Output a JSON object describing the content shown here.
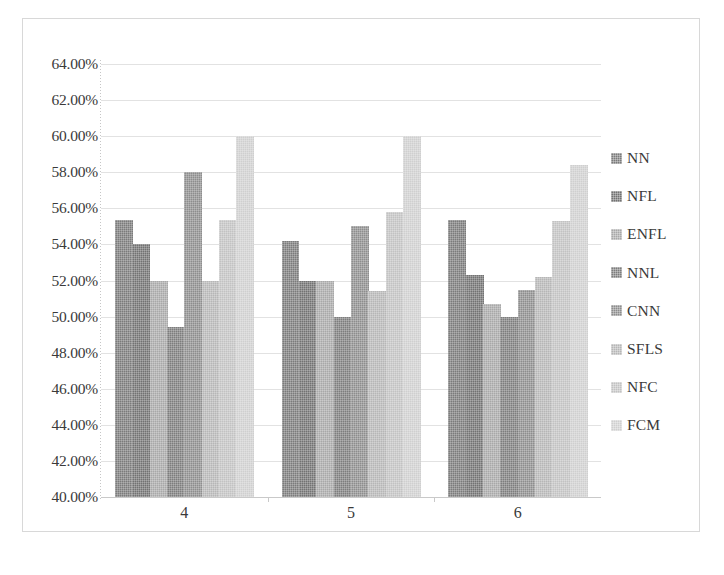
{
  "chart_data": {
    "type": "bar",
    "title": "",
    "subtitle": "",
    "xlabel": "",
    "ylabel": "",
    "categories": [
      "4",
      "5",
      "6"
    ],
    "ylim": [
      40,
      64
    ],
    "ytick_values": [
      64,
      62,
      60,
      58,
      56,
      54,
      52,
      50,
      48,
      46,
      44,
      42,
      40
    ],
    "ytick_labels": [
      "64.00%",
      "62.00%",
      "60.00%",
      "58.00%",
      "56.00%",
      "54.00%",
      "52.00%",
      "50.00%",
      "48.00%",
      "46.00%",
      "44.00%",
      "42.00%",
      "40.00%"
    ],
    "grid": true,
    "grid_axis": "y",
    "legend_position": "right",
    "value_unit": "%",
    "series": [
      {
        "name": "NN",
        "color": "#7b7b7b",
        "values": [
          55.35,
          54.2,
          55.35
        ]
      },
      {
        "name": "NFL",
        "color": "#727272",
        "values": [
          54.0,
          52.0,
          52.3
        ]
      },
      {
        "name": "ENFL",
        "color": "#a8a8a8",
        "values": [
          52.0,
          52.0,
          50.7
        ]
      },
      {
        "name": "NNL",
        "color": "#7d7d7d",
        "values": [
          49.4,
          50.0,
          50.0
        ]
      },
      {
        "name": "CNN",
        "color": "#8d8d8d",
        "values": [
          58.0,
          55.0,
          51.5
        ]
      },
      {
        "name": "SFLS",
        "color": "#b6b6b6",
        "values": [
          52.0,
          51.4,
          52.2
        ]
      },
      {
        "name": "NFC",
        "color": "#c2c2c2",
        "values": [
          55.35,
          55.8,
          55.3
        ]
      },
      {
        "name": "FCM",
        "color": "#cfcfcf",
        "values": [
          60.0,
          60.0,
          58.4
        ]
      }
    ]
  },
  "legend": {
    "items": [
      {
        "label": "NN",
        "swatch_color": "#7b7b7b"
      },
      {
        "label": "NFL",
        "swatch_color": "#727272"
      },
      {
        "label": "ENFL",
        "swatch_color": "#a8a8a8"
      },
      {
        "label": "NNL",
        "swatch_color": "#7d7d7d"
      },
      {
        "label": "CNN",
        "swatch_color": "#8d8d8d"
      },
      {
        "label": "SFLS",
        "swatch_color": "#b6b6b6"
      },
      {
        "label": "NFC",
        "swatch_color": "#c2c2c2"
      },
      {
        "label": "FCM",
        "swatch_color": "#cfcfcf"
      }
    ]
  },
  "colors": {
    "background": "#ffffff",
    "frame_border": "#d8d8d8",
    "gridline": "#e2e2e2",
    "axis_line": "#c9c9c9",
    "tick_text": "#3a3a3a"
  }
}
